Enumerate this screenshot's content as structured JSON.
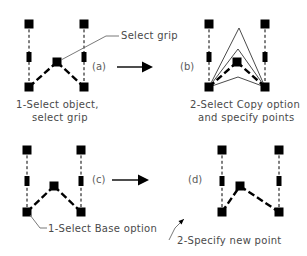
{
  "diagram": {
    "background_color": "#ffffff",
    "ink_color": "#000000",
    "caption_color": "#4a4a4a",
    "panels": [
      {
        "key": "a",
        "label": "(a)",
        "caption_line1": "1-Select object,",
        "caption_line2": "select grip",
        "callout": "Select grip"
      },
      {
        "key": "b",
        "label": "(b)",
        "caption_line1": "2-Select Copy option",
        "caption_line2": "and specify points",
        "callout": ""
      },
      {
        "key": "c",
        "label": "(c)",
        "caption_line1": "1-Select Base option",
        "caption_line2": "",
        "callout": ""
      },
      {
        "key": "d",
        "label": "(d)",
        "caption_line1": "2-Specify new point",
        "caption_line2": "",
        "callout": ""
      }
    ],
    "geometry": {
      "panel_a": {
        "left_top_grip": [
          29,
          24
        ],
        "left_mid_grip": [
          29,
          57
        ],
        "left_bottom_grip": [
          29,
          87
        ],
        "right_top_grip": [
          84,
          24
        ],
        "right_mid_grip": [
          84,
          57
        ],
        "right_bottom_grip": [
          84,
          87
        ],
        "apex_grip": [
          57,
          62
        ]
      },
      "panel_b": {
        "left_top_grip": [
          209,
          24
        ],
        "left_mid_grip": [
          209,
          57
        ],
        "left_bottom_grip": [
          209,
          87
        ],
        "right_top_grip": [
          265,
          24
        ],
        "right_mid_grip": [
          265,
          57
        ],
        "right_bottom_grip": [
          265,
          87
        ],
        "apex_grip": [
          237,
          62
        ],
        "copy_apex_points": [
          [
            239,
            28
          ],
          [
            238,
            49
          ],
          [
            238,
            77
          ]
        ]
      },
      "panel_c": {
        "left_top_grip": [
          27,
          150
        ],
        "left_mid_grip": [
          27,
          181
        ],
        "left_bottom_grip": [
          27,
          212
        ],
        "right_top_grip": [
          81,
          150
        ],
        "right_mid_grip": [
          81,
          181
        ],
        "right_bottom_grip": [
          81,
          212
        ],
        "apex_grip": [
          54,
          186
        ]
      },
      "panel_d": {
        "left_top_grip": [
          222,
          150
        ],
        "left_mid_grip": [
          222,
          181
        ],
        "left_bottom_grip": [
          222,
          212
        ],
        "right_top_grip": [
          279,
          150
        ],
        "right_mid_grip": [
          279,
          181
        ],
        "right_bottom_grip": [
          279,
          212
        ],
        "apex_grip": [
          240,
          186
        ]
      }
    },
    "flow_arrows": [
      {
        "name": "arrow-a-to-b",
        "x1": 117,
        "x2": 152,
        "y": 67
      },
      {
        "name": "arrow-c-to-d",
        "x1": 112,
        "x2": 148,
        "y": 180
      }
    ]
  }
}
